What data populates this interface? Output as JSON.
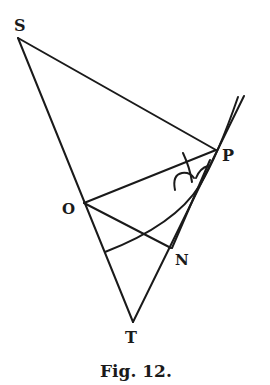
{
  "figure": {
    "caption": "Fig. 12.",
    "ink_color": "#1a1a1a",
    "background": "#ffffff"
  },
  "points": {
    "S": {
      "label": "S"
    },
    "P": {
      "label": "P"
    },
    "O": {
      "label": "O"
    },
    "N": {
      "label": "N"
    },
    "T": {
      "label": "T"
    }
  }
}
